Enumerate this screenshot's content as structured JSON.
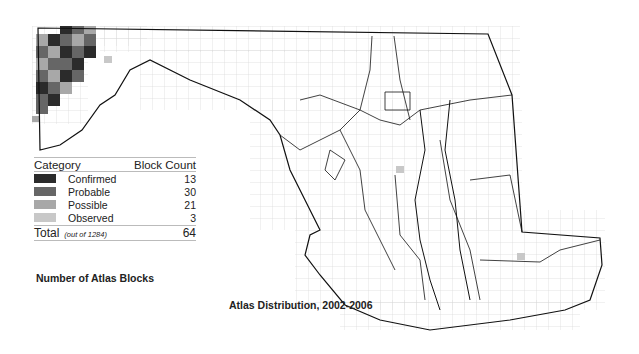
{
  "map": {
    "region": "Maryland",
    "title": "Atlas Distribution, 2002-2006",
    "subtitle": "Number of Atlas Blocks",
    "colors": {
      "confirmed": "#2b2b2b",
      "probable": "#666666",
      "possible": "#a8a8a8",
      "observed": "#c8c8c8",
      "grid": "#d4d4d4",
      "outline": "#111111"
    }
  },
  "legend": {
    "header_category": "Category",
    "header_count": "Block Count",
    "rows": [
      {
        "label": "Confirmed",
        "count": "13"
      },
      {
        "label": "Probable",
        "count": "30"
      },
      {
        "label": "Possible",
        "count": "21"
      },
      {
        "label": "Observed",
        "count": "3"
      }
    ],
    "total_label": "Total",
    "total_note": "(out of 1284)",
    "total_count": "64"
  }
}
